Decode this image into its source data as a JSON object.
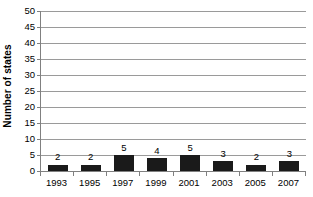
{
  "chart_data": {
    "type": "bar",
    "title": "",
    "xlabel": "",
    "ylabel": "Number of states",
    "categories": [
      "1993",
      "1995",
      "1997",
      "1999",
      "2001",
      "2003",
      "2005",
      "2007"
    ],
    "values": [
      2,
      2,
      5,
      4,
      5,
      3,
      2,
      3
    ],
    "data_labels": [
      "2",
      "2",
      "5",
      "4",
      "5",
      "3",
      "2",
      "3"
    ],
    "ylim": [
      0,
      50
    ],
    "yticks": [
      0,
      5,
      10,
      15,
      20,
      25,
      30,
      35,
      40,
      45,
      50
    ],
    "ytick_labels": [
      "0",
      "5",
      "10",
      "15",
      "20",
      "25",
      "30",
      "35",
      "40",
      "45",
      "50"
    ],
    "grid": "horizontal",
    "legend": "none",
    "bar_color": "#1a1a1a",
    "gridline_color": "#9a9a9a",
    "axis_color": "#808080",
    "background_color": "#ffffff"
  }
}
